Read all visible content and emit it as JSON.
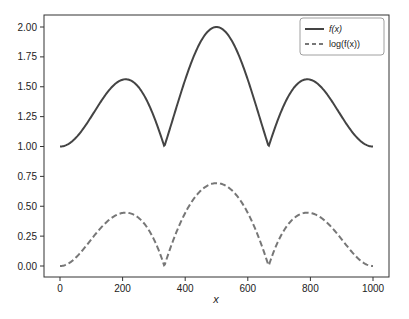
{
  "chart_data": {
    "type": "line",
    "title": "",
    "xlabel": "x",
    "ylabel": "",
    "xlim": [
      -30,
      1050
    ],
    "ylim": [
      -0.1,
      2.1
    ],
    "grid": false,
    "legend_position": "upper right",
    "xticks": [
      0,
      200,
      400,
      600,
      800,
      1000
    ],
    "xtick_labels": [
      "0",
      "200",
      "400",
      "600",
      "800",
      "1000"
    ],
    "yticks": [
      0.0,
      0.25,
      0.5,
      0.75,
      1.0,
      1.25,
      1.5,
      1.75,
      2.0
    ],
    "ytick_labels": [
      "0.00",
      "0.25",
      "0.50",
      "0.75",
      "1.00",
      "1.25",
      "1.50",
      "1.75",
      "2.00"
    ],
    "x": [
      0,
      50,
      100,
      150,
      200,
      250,
      300,
      333.3,
      350,
      400,
      450,
      500,
      550,
      600,
      650,
      666.7,
      700,
      750,
      800,
      850,
      900,
      950,
      1000
    ],
    "series": [
      {
        "name": "f(x)",
        "style": "solid",
        "color": "#444444",
        "values": [
          1.0,
          1.071,
          1.25,
          1.449,
          1.559,
          1.5,
          1.25,
          1.0,
          1.139,
          1.559,
          1.88,
          2.0,
          1.88,
          1.559,
          1.139,
          1.0,
          1.25,
          1.5,
          1.559,
          1.449,
          1.25,
          1.071,
          1.0
        ]
      },
      {
        "name": "log(f(x))",
        "style": "dashed",
        "color": "#777777",
        "values": [
          0.0,
          0.069,
          0.223,
          0.371,
          0.444,
          0.405,
          0.223,
          0.0,
          0.13,
          0.444,
          0.631,
          0.693,
          0.631,
          0.444,
          0.13,
          0.0,
          0.223,
          0.405,
          0.444,
          0.371,
          0.223,
          0.069,
          0.0
        ]
      }
    ]
  }
}
